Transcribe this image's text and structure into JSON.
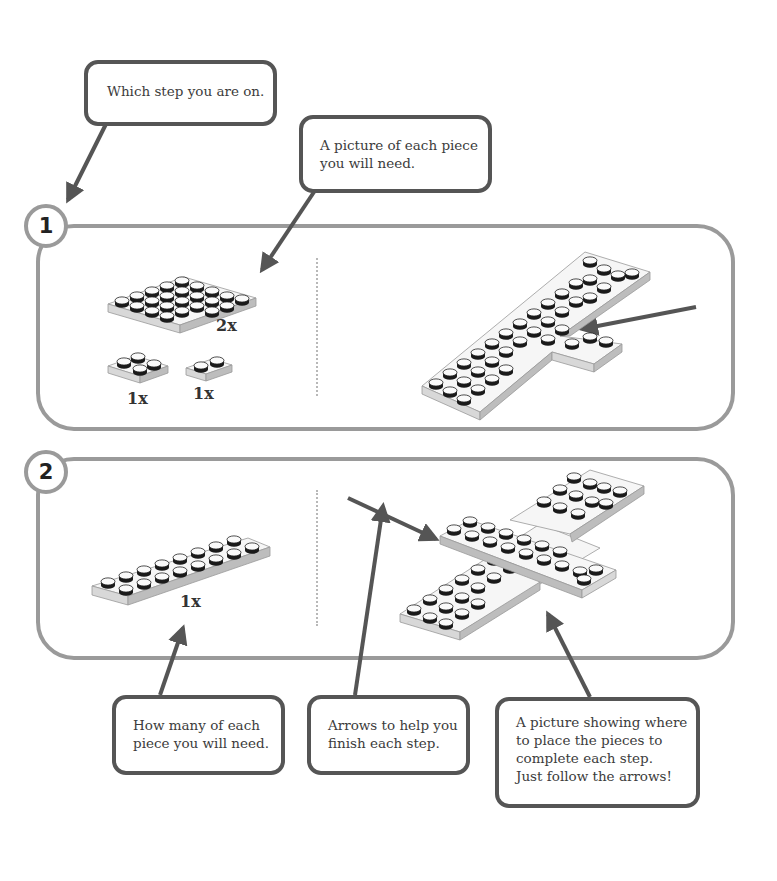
{
  "callouts": {
    "step_indicator": {
      "lines": [
        "Which step you are on."
      ]
    },
    "piece_picture": {
      "lines": [
        "A picture of each piece",
        "you will need."
      ]
    },
    "quantity": {
      "lines": [
        "How many of each",
        "piece you will need."
      ]
    },
    "arrows": {
      "lines": [
        "Arrows to help you",
        "finish each step."
      ]
    },
    "placement": {
      "lines": [
        "A picture showing where",
        "to place the pieces to",
        "complete each step.",
        "Just follow the arrows!"
      ]
    }
  },
  "steps": [
    {
      "number": "1",
      "parts": [
        {
          "piece": "4x6 plate",
          "quantity": "2x"
        },
        {
          "piece": "2x2 plate",
          "quantity": "1x"
        },
        {
          "piece": "1x2 plate",
          "quantity": "1x"
        }
      ]
    },
    {
      "number": "2",
      "parts": [
        {
          "piece": "2x8 plate",
          "quantity": "1x"
        }
      ]
    }
  ],
  "colors": {
    "panel_border": "#9a9a9a",
    "callout_border": "#555555",
    "arrow": "#555555",
    "divider": "#b8b8b8"
  }
}
